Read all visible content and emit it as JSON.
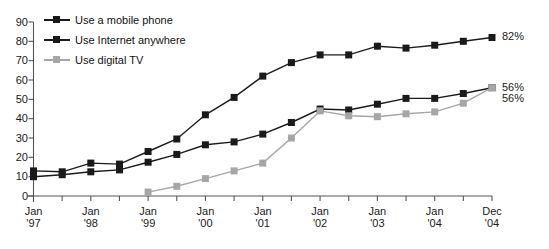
{
  "chart_data": {
    "type": "line",
    "title": "",
    "subtitle": "",
    "xlabel": "",
    "ylabel": "",
    "ylim": [
      0,
      90
    ],
    "grid": false,
    "legend_position": "top-left",
    "y_ticks": [
      "0",
      "10",
      "20",
      "30",
      "40",
      "50",
      "60",
      "70",
      "80",
      "90"
    ],
    "x_tick_labels": [
      {
        "mon": "Jan",
        "yr": "'97"
      },
      {
        "mon": "Jan",
        "yr": "'98"
      },
      {
        "mon": "Jan",
        "yr": "'99"
      },
      {
        "mon": "Jan",
        "yr": "'00"
      },
      {
        "mon": "Jan",
        "yr": "'01"
      },
      {
        "mon": "Jan",
        "yr": "'02"
      },
      {
        "mon": "Jan",
        "yr": "'03"
      },
      {
        "mon": "Jan",
        "yr": "'04"
      },
      {
        "mon": "Dec",
        "yr": "'04"
      }
    ],
    "x": [
      "Jan '97",
      "Jul '97",
      "Jan '98",
      "Jul '98",
      "Jan '99",
      "Jul '99",
      "Jan '00",
      "Jul '00",
      "Jan '01",
      "Jul '01",
      "Jan '02",
      "Jul '02",
      "Jan '03",
      "Jul '03",
      "Jan '04",
      "Jul '04",
      "Dec '04"
    ],
    "series": [
      {
        "name": "Use a mobile phone",
        "color": "#1a1a1a",
        "end_label": "82%",
        "values": [
          13,
          12.5,
          17,
          16.5,
          23,
          29.5,
          42,
          51,
          62,
          69,
          73,
          73,
          77.5,
          76.5,
          78,
          80,
          82
        ]
      },
      {
        "name": "Use Internet anywhere",
        "color": "#1a1a1a",
        "end_label": "56%",
        "values": [
          10,
          11,
          12.5,
          13.5,
          17.5,
          21.5,
          26.5,
          28,
          32,
          38,
          45,
          44.5,
          47.5,
          50.5,
          50.5,
          53,
          56
        ]
      },
      {
        "name": "Use digital TV",
        "color": "#a6a6a6",
        "end_label": "56%",
        "values": [
          null,
          null,
          null,
          null,
          2,
          5,
          9,
          13,
          17,
          30,
          44,
          41.5,
          41,
          42.5,
          43.5,
          48,
          56
        ]
      }
    ]
  }
}
